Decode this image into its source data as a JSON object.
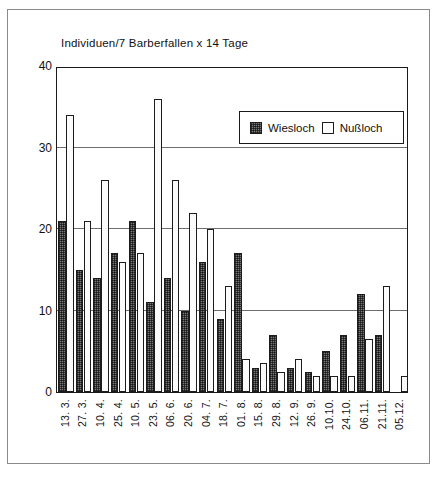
{
  "chart_data": {
    "type": "bar",
    "title": "Individuen/7 Barberfallen x 14 Tage",
    "xlabel": "",
    "ylabel": "",
    "ylim": [
      0,
      40
    ],
    "yticks": [
      0,
      10,
      20,
      30,
      40
    ],
    "grid": true,
    "legend_position": "top-right",
    "categories": [
      "13. 3.",
      "27. 3.",
      "10. 4.",
      "25. 4.",
      "10. 5.",
      "23. 5.",
      "06. 6.",
      "20. 6.",
      "04. 7.",
      "18. 7.",
      "01. 8.",
      "15. 8.",
      "29. 8.",
      "12. 9.",
      "26. 9.",
      "10.10.",
      "24.10.",
      "06.11.",
      "21.11.",
      "05.12."
    ],
    "series": [
      {
        "name": "Wiesloch",
        "color": "#787878",
        "pattern": "crosshatch",
        "values": [
          21,
          15,
          14,
          17,
          21,
          11,
          14,
          10,
          16,
          9,
          17,
          3,
          7,
          3,
          2.5,
          5,
          7,
          12,
          7,
          0
        ]
      },
      {
        "name": "Nußloch",
        "color": "#ffffff",
        "pattern": "solid",
        "values": [
          34,
          21,
          26,
          16,
          17,
          36,
          26,
          22,
          20,
          13,
          4,
          3.5,
          2.5,
          4,
          2,
          2,
          2,
          6.5,
          13,
          2
        ]
      }
    ]
  },
  "legend": {
    "items": [
      {
        "label": "Wiesloch",
        "swatch": "hatched-square-icon"
      },
      {
        "label": "Nußloch",
        "swatch": "white-square-icon"
      }
    ]
  }
}
